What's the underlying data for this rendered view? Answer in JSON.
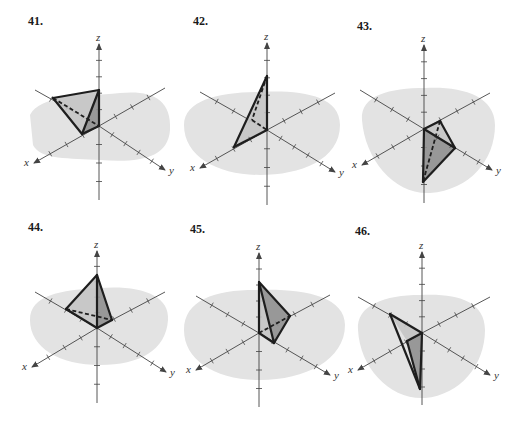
{
  "page": {
    "background": "#ffffff",
    "colors": {
      "region": "#e3e3e3",
      "face_light": "#c4c4c4",
      "face_dark": "#8f8f8f",
      "edge": "#1e1e1e",
      "axis": "#444444"
    }
  },
  "panels": [
    {
      "label": "41.",
      "label_pos": [
        28,
        14
      ],
      "origin": [
        99,
        126
      ],
      "axes": {
        "x_label": "x",
        "y_label": "y",
        "z_label": "z"
      },
      "x_end": [
        34,
        163
      ],
      "y_end": [
        165,
        170
      ],
      "neg_x_end": [
        165,
        88
      ],
      "neg_y_end": [
        35,
        90
      ],
      "z_top": [
        99,
        44
      ],
      "z_bottom": [
        99,
        200
      ],
      "blob": "M30,115 C40,95 80,97 120,93 C150,90 172,98 170,130 C168,158 140,163 100,160 C70,158 40,160 33,145 Z",
      "faces": [
        {
          "points": "53,98 99,90 82,134",
          "shade": "light"
        },
        {
          "points": "99,90 82,134 99,126",
          "shade": "dark"
        }
      ],
      "edges_solid": [
        [
          53,
          98,
          99,
          90
        ],
        [
          53,
          98,
          82,
          134
        ],
        [
          99,
          90,
          82,
          134
        ],
        [
          99,
          90,
          99,
          126
        ],
        [
          82,
          134,
          99,
          126
        ]
      ],
      "edges_dashed": [
        [
          53,
          98,
          99,
          126
        ]
      ]
    },
    {
      "label": "42.",
      "label_pos": [
        193,
        14
      ],
      "origin": [
        267,
        130
      ],
      "axes": {
        "x_label": "x",
        "y_label": "y",
        "z_label": "z"
      },
      "x_end": [
        200,
        168
      ],
      "y_end": [
        335,
        172
      ],
      "neg_x_end": [
        335,
        93
      ],
      "neg_y_end": [
        200,
        92
      ],
      "z_top": [
        267,
        43
      ],
      "z_bottom": [
        267,
        205
      ],
      "blob": "M184,125 C184,100 220,92 260,92 C300,90 340,95 340,125 C340,160 300,175 260,175 C220,175 184,158 184,125 Z",
      "faces": [
        {
          "points": "267,76 234,147 267,130",
          "shade": "light"
        }
      ],
      "edges_solid": [
        [
          267,
          76,
          234,
          147
        ],
        [
          267,
          76,
          267,
          130
        ],
        [
          234,
          147,
          267,
          130
        ]
      ],
      "edges_dashed": [
        [
          267,
          76,
          252,
          120
        ],
        [
          252,
          120,
          267,
          130
        ]
      ]
    },
    {
      "label": "43.",
      "label_pos": [
        357,
        19
      ],
      "origin": [
        424,
        129
      ],
      "axes": {
        "x_label": "x",
        "y_label": "y",
        "z_label": "z"
      },
      "x_end": [
        362,
        165
      ],
      "y_end": [
        492,
        170
      ],
      "neg_x_end": [
        490,
        93
      ],
      "neg_y_end": [
        360,
        90
      ],
      "z_top": [
        424,
        45
      ],
      "z_bottom": [
        424,
        203
      ],
      "blob": "M362,120 C360,95 390,88 425,88 C460,86 495,95 495,125 C495,160 470,190 430,193 C395,195 365,160 362,120 Z",
      "faces": [
        {
          "points": "424,129 440,121 455,148",
          "shade": "light"
        },
        {
          "points": "424,129 455,148 423,182",
          "shade": "dark"
        }
      ],
      "edges_solid": [
        [
          424,
          129,
          440,
          121
        ],
        [
          440,
          121,
          455,
          148
        ],
        [
          455,
          148,
          423,
          182
        ],
        [
          423,
          182,
          424,
          129
        ],
        [
          424,
          129,
          455,
          148
        ]
      ],
      "edges_dashed": [
        [
          440,
          121,
          423,
          182
        ]
      ]
    },
    {
      "label": "44.",
      "label_pos": [
        28,
        220
      ],
      "origin": [
        97,
        328
      ],
      "axes": {
        "x_label": "x",
        "y_label": "y",
        "z_label": "z"
      },
      "x_end": [
        32,
        367
      ],
      "y_end": [
        166,
        372
      ],
      "neg_x_end": [
        165,
        292
      ],
      "neg_y_end": [
        35,
        292
      ],
      "z_top": [
        97,
        251
      ],
      "z_bottom": [
        97,
        403
      ],
      "blob": "M30,320 C30,295 60,290 100,288 C140,285 170,295 168,320 C166,350 140,365 100,365 C60,365 30,348 30,320 Z",
      "faces": [
        {
          "points": "66,309 97,275 97,328",
          "shade": "light"
        },
        {
          "points": "97,275 112,320 97,328",
          "shade": "dark"
        }
      ],
      "edges_solid": [
        [
          66,
          309,
          97,
          275
        ],
        [
          97,
          275,
          112,
          320
        ],
        [
          66,
          309,
          97,
          328
        ],
        [
          97,
          328,
          112,
          320
        ],
        [
          97,
          275,
          97,
          328
        ]
      ],
      "edges_dashed": [
        [
          66,
          309,
          112,
          320
        ]
      ]
    },
    {
      "label": "45.",
      "label_pos": [
        190,
        222
      ],
      "origin": [
        259,
        333
      ],
      "axes": {
        "x_label": "x",
        "y_label": "y",
        "z_label": "z"
      },
      "x_end": [
        196,
        370
      ],
      "y_end": [
        330,
        375
      ],
      "neg_x_end": [
        330,
        295
      ],
      "neg_y_end": [
        196,
        296
      ],
      "z_top": [
        259,
        253
      ],
      "z_bottom": [
        259,
        407
      ],
      "blob": "M184,330 C184,300 215,290 255,290 C300,288 345,295 345,325 C345,360 305,380 260,380 C215,380 184,360 184,330 Z",
      "faces": [
        {
          "points": "259,282 290,316 274,343",
          "shade": "dark"
        },
        {
          "points": "259,282 274,343 259,333",
          "shade": "light"
        }
      ],
      "edges_solid": [
        [
          259,
          282,
          290,
          316
        ],
        [
          290,
          316,
          274,
          343
        ],
        [
          274,
          343,
          259,
          333
        ],
        [
          259,
          333,
          259,
          282
        ],
        [
          259,
          282,
          274,
          343
        ]
      ],
      "edges_dashed": [
        [
          259,
          333,
          290,
          316
        ]
      ]
    },
    {
      "label": "46.",
      "label_pos": [
        355,
        224
      ],
      "origin": [
        422,
        333
      ],
      "axes": {
        "x_label": "x",
        "y_label": "y",
        "z_label": "z"
      },
      "x_end": [
        358,
        370
      ],
      "y_end": [
        490,
        375
      ],
      "neg_x_end": [
        490,
        297
      ],
      "neg_y_end": [
        358,
        297
      ],
      "z_top": [
        422,
        252
      ],
      "z_bottom": [
        422,
        405
      ],
      "blob": "M358,330 C356,305 385,295 420,295 C455,293 485,300 485,330 C485,365 460,395 425,398 C390,400 360,368 358,330 Z",
      "faces": [
        {
          "points": "390,314 422,333 407,341",
          "shade": "light"
        },
        {
          "points": "422,333 407,341 420,389",
          "shade": "dark"
        }
      ],
      "edges_solid": [
        [
          390,
          314,
          422,
          333
        ],
        [
          390,
          314,
          420,
          389
        ],
        [
          422,
          333,
          420,
          389
        ],
        [
          422,
          333,
          407,
          341
        ],
        [
          407,
          341,
          420,
          389
        ]
      ],
      "edges_dashed": []
    }
  ]
}
